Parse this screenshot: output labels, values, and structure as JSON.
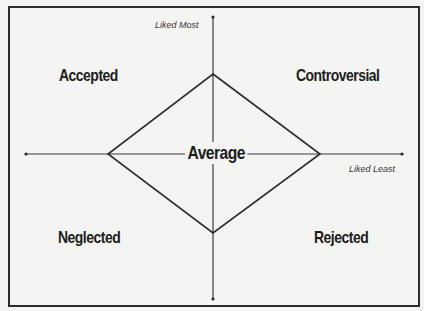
{
  "diagram": {
    "type": "quadrant-diagram",
    "axes": {
      "vertical_label": "Liked Most",
      "horizontal_label": "Liked Least"
    },
    "quadrants": {
      "top_left": "Accepted",
      "top_right": "Controversial",
      "bottom_left": "Neglected",
      "bottom_right": "Rejected"
    },
    "center": "Average",
    "colors": {
      "line": "#2b2b2b",
      "text": "#1c1c1c",
      "background": "#f4f4f2"
    }
  }
}
